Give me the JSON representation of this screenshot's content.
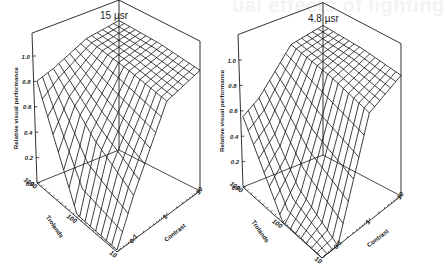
{
  "page": {
    "ghost_heading": "ual effects of lighting"
  },
  "chart_data": [
    {
      "type": "surface3d",
      "title": "15 µsr",
      "zlabel": "Relative visual performance",
      "xlabel": "Trolands",
      "ylabel": "Contrast",
      "z_ticks": [
        "0.0",
        "0.2",
        "0.4",
        "0.6",
        "0.8",
        "1.0"
      ],
      "z_range": [
        0,
        1.1
      ],
      "trolands_ticks": [
        "10",
        "100",
        "1000"
      ],
      "trolands_range_log10": [
        1,
        3
      ],
      "contrast_ticks": [
        "0.1",
        "1",
        "10"
      ],
      "contrast_range_log10": [
        -1.5,
        1
      ],
      "grid_lines": 15,
      "surface_samples": {
        "trolands": [
          10,
          100,
          1000
        ],
        "contrast": [
          0.03,
          0.1,
          1,
          10
        ],
        "values": [
          [
            0.0,
            0.35,
            0.9,
            0.95
          ],
          [
            0.0,
            0.55,
            0.95,
            1.0
          ],
          [
            0.8,
            0.85,
            0.98,
            1.02
          ]
        ]
      },
      "geometry": {
        "floor_left": [
          37,
          183
        ],
        "floor_front": [
          117,
          252
        ],
        "floor_right": [
          200,
          191
        ],
        "floor_back": [
          119,
          150
        ],
        "z_unit_px": 127,
        "box_top": 1.18,
        "title_pos": [
          102,
          9
        ]
      }
    },
    {
      "type": "surface3d",
      "title": "4.8 µsr",
      "zlabel": "Relative visual performance",
      "xlabel": "Trolands",
      "ylabel": "Contrast",
      "z_ticks": [
        "0.0",
        "0.2",
        "0.4",
        "0.6",
        "0.8",
        "1.0"
      ],
      "z_range": [
        0,
        1.1
      ],
      "trolands_ticks": [
        "10",
        "100",
        "1000"
      ],
      "trolands_range_log10": [
        1,
        3
      ],
      "contrast_ticks": [
        "0.1",
        "1",
        "10"
      ],
      "contrast_range_log10": [
        -1.5,
        1
      ],
      "grid_lines": 15,
      "surface_samples": {
        "trolands": [
          10,
          100,
          1000
        ],
        "contrast": [
          0.03,
          0.1,
          1,
          10
        ],
        "values": [
          [
            0.0,
            0.0,
            0.85,
            0.95
          ],
          [
            0.0,
            0.2,
            0.93,
            1.0
          ],
          [
            0.55,
            0.65,
            0.97,
            1.02
          ]
        ]
      },
      "geometry": {
        "floor_left": [
          243,
          187
        ],
        "floor_front": [
          322,
          258
        ],
        "floor_right": [
          401,
          196
        ],
        "floor_back": [
          323,
          155
        ],
        "z_unit_px": 127,
        "box_top": 1.2,
        "title_pos": [
          312,
          12
        ]
      }
    }
  ]
}
